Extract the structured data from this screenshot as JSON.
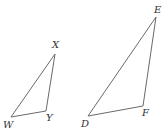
{
  "diagram": {
    "type": "geometry",
    "stroke_color": "#6a6a6a",
    "label_color": "#333333",
    "triangles": [
      {
        "name": "WXY",
        "vertices": [
          {
            "label": "W",
            "x": 11,
            "y": 117,
            "lx": 3,
            "ly": 128
          },
          {
            "label": "X",
            "x": 55,
            "y": 54,
            "lx": 52,
            "ly": 48
          },
          {
            "label": "Y",
            "x": 46,
            "y": 111,
            "lx": 46,
            "ly": 121
          }
        ]
      },
      {
        "name": "DEF",
        "vertices": [
          {
            "label": "D",
            "x": 88,
            "y": 116,
            "lx": 81,
            "ly": 127
          },
          {
            "label": "E",
            "x": 156,
            "y": 17,
            "lx": 154,
            "ly": 13
          },
          {
            "label": "F",
            "x": 143,
            "y": 106,
            "lx": 142,
            "ly": 116
          }
        ]
      }
    ]
  }
}
